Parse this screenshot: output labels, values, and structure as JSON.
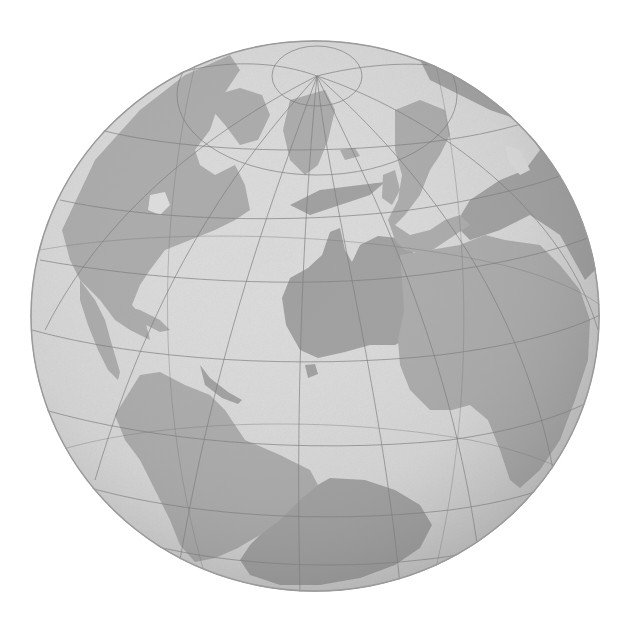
{
  "image": {
    "subject": "transparent grayscale globe with latitude/longitude graticule",
    "background": "#ffffff",
    "globe": {
      "cx": 315,
      "cy": 316,
      "rx": 285,
      "ry": 276,
      "ocean_color": "#dcdcdc",
      "ocean_shade_color": "#b5b5b5",
      "front_land_color": "#a8a8a8",
      "back_land_color": "#9c9c9c",
      "graticule_color": "#7d7d7d",
      "north_pole": {
        "x": 317,
        "y": 76
      }
    },
    "front_continents": [
      "North America",
      "Greenland",
      "Central America",
      "South America",
      "Europe",
      "Africa",
      "Arabia"
    ],
    "see_through_continents": [
      "Australia",
      "Antarctica",
      "Asia",
      "New Zealand"
    ]
  }
}
